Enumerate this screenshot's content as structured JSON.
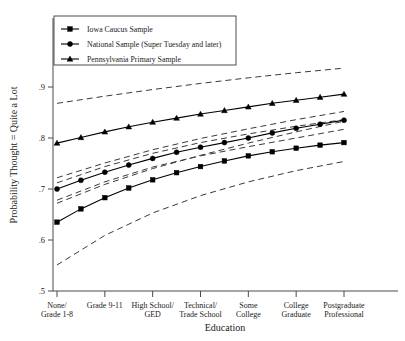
{
  "chart_data": {
    "type": "line",
    "title": "",
    "xlabel": "Education",
    "ylabel": "Probability Thought = Quite a Lot",
    "categories": [
      "None/\nGrade 1-8",
      "Grade 9-11",
      "High School/\nGED",
      "Technical/\nTrade School",
      "Some\nCollege",
      "College\nGraduate",
      "Postgraduate\nProfessional"
    ],
    "category_lines": [
      [
        "None/",
        "Grade 1-8"
      ],
      [
        "Grade 9-11",
        ""
      ],
      [
        "High School/",
        "GED"
      ],
      [
        "Technical/",
        "Trade School"
      ],
      [
        "Some",
        "College"
      ],
      [
        "College",
        "Graduate"
      ],
      [
        "Postgraduate",
        "Professional"
      ]
    ],
    "x": [
      1,
      2,
      3,
      4,
      5,
      6,
      7
    ],
    "ylim": [
      0.5,
      0.95
    ],
    "yticks": [
      0.5,
      0.6,
      0.7,
      0.8,
      0.9
    ],
    "ytick_labels": [
      ".5",
      ".6",
      ".7",
      ".8",
      ".9"
    ],
    "grid": false,
    "legend_position": "top-left",
    "series": [
      {
        "name": "Iowa Caucus Sample",
        "marker": "square",
        "linestyle": "solid",
        "values": [
          0.635,
          0.683,
          0.718,
          0.744,
          0.765,
          0.78,
          0.791
        ],
        "dense_values": [
          0.635,
          0.661,
          0.683,
          0.702,
          0.718,
          0.732,
          0.744,
          0.755,
          0.765,
          0.773,
          0.78,
          0.786,
          0.791
        ],
        "ci_upper": [
          0.672,
          0.709,
          0.74,
          0.766,
          0.79,
          0.812,
          0.833
        ],
        "ci_lower": [
          0.551,
          0.609,
          0.653,
          0.687,
          0.714,
          0.736,
          0.754
        ]
      },
      {
        "name": "National Sample (Super Tuesday and later)",
        "marker": "circle",
        "linestyle": "solid",
        "values": [
          0.7,
          0.733,
          0.76,
          0.782,
          0.8,
          0.819,
          0.835
        ],
        "dense_values": [
          0.7,
          0.717,
          0.733,
          0.747,
          0.76,
          0.772,
          0.782,
          0.791,
          0.8,
          0.81,
          0.819,
          0.827,
          0.835
        ],
        "ci_upper": [
          0.722,
          0.751,
          0.777,
          0.799,
          0.818,
          0.836,
          0.852
        ],
        "ci_lower": [
          0.678,
          0.714,
          0.743,
          0.765,
          0.783,
          0.8,
          0.817
        ]
      },
      {
        "name": "Pennsylvania Primary Sample",
        "marker": "triangle",
        "linestyle": "solid",
        "values": [
          0.79,
          0.812,
          0.831,
          0.847,
          0.861,
          0.874,
          0.886
        ],
        "dense_values": [
          0.79,
          0.801,
          0.812,
          0.822,
          0.831,
          0.839,
          0.847,
          0.854,
          0.861,
          0.868,
          0.874,
          0.88,
          0.886
        ],
        "ci_upper": [
          0.868,
          0.882,
          0.895,
          0.907,
          0.918,
          0.928,
          0.937
        ],
        "ci_lower": [
          0.712,
          0.744,
          0.77,
          0.791,
          0.808,
          0.823,
          0.836
        ]
      }
    ]
  },
  "legend": {
    "items": [
      {
        "label": "Iowa Caucus Sample",
        "marker": "square"
      },
      {
        "label": "National Sample (Super Tuesday and later)",
        "marker": "circle"
      },
      {
        "label": "Pennsylvania Primary Sample",
        "marker": "triangle"
      }
    ]
  }
}
